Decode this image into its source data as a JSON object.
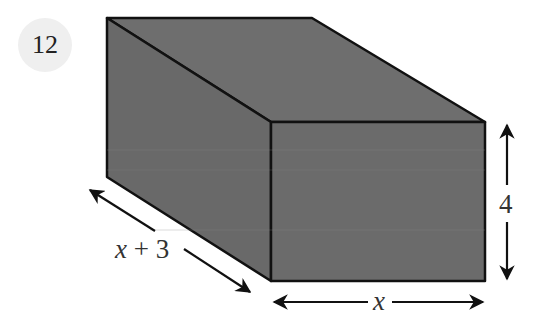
{
  "problem": {
    "number": "12"
  },
  "figure": {
    "type": "rectangular prism",
    "face_color": "#6b6b6b",
    "edge_color": "#111111",
    "dimensions": {
      "depth_label": "x + 3",
      "width_label": "x",
      "height_label": "4"
    }
  }
}
